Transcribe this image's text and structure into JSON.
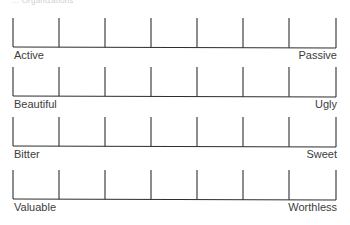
{
  "header": {
    "text": "... Organizations"
  },
  "scale": {
    "points": 7,
    "tick_x": [
      13,
      59,
      105,
      151,
      197,
      243,
      289,
      336
    ],
    "line_color": "#2e2e2e",
    "tick_height": 29
  },
  "items": [
    {
      "left": "Active",
      "right": "Passive",
      "top": 18
    },
    {
      "left": "Beautiful",
      "right": "Ugly",
      "top": 67
    },
    {
      "left": "Bitter",
      "right": "Sweet",
      "top": 117
    },
    {
      "left": "Valuable",
      "right": "Worthless",
      "top": 170
    }
  ]
}
